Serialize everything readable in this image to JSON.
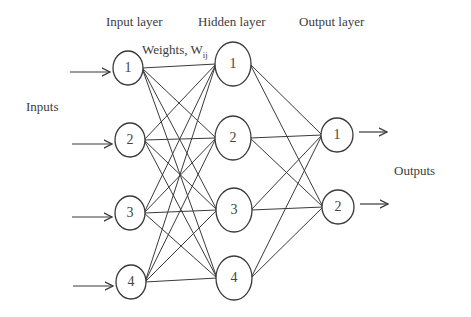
{
  "labels": {
    "input_layer": "Input layer",
    "hidden_layer": "Hidden layer",
    "output_layer": "Output layer",
    "weights": "Weights, W",
    "weights_sub": "ij",
    "inputs": "Inputs",
    "outputs": "Outputs"
  },
  "layers": {
    "input": [
      {
        "label": "1",
        "x": 128,
        "y": 68
      },
      {
        "label": "2",
        "x": 130,
        "y": 140
      },
      {
        "label": "3",
        "x": 130,
        "y": 213
      },
      {
        "label": "4",
        "x": 131,
        "y": 282
      }
    ],
    "hidden": [
      {
        "label": "1",
        "x": 233,
        "y": 64
      },
      {
        "label": "2",
        "x": 233,
        "y": 138
      },
      {
        "label": "3",
        "x": 234,
        "y": 210
      },
      {
        "label": "4",
        "x": 234,
        "y": 278
      }
    ],
    "output": [
      {
        "label": "1",
        "x": 337,
        "y": 135
      },
      {
        "label": "2",
        "x": 338,
        "y": 207
      }
    ]
  },
  "colors": {
    "stroke": "#3a3a3a",
    "background": "#ffffff"
  }
}
